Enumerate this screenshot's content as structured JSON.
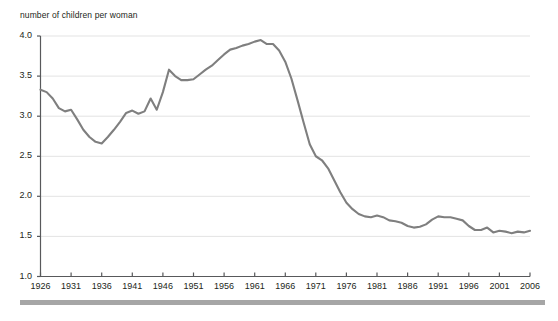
{
  "chart_data": {
    "type": "line",
    "title": "",
    "axis_note": "number of children per woman",
    "xlabel": "",
    "ylabel": "number of children per woman",
    "xlim": [
      1926,
      2006
    ],
    "ylim": [
      1.0,
      4.0
    ],
    "grid": true,
    "grid_axis": "y",
    "legend": false,
    "line_color": "#7f7f7f",
    "x_ticks": [
      1926,
      1931,
      1936,
      1941,
      1946,
      1951,
      1956,
      1961,
      1966,
      1971,
      1976,
      1981,
      1986,
      1991,
      1996,
      2001,
      2006
    ],
    "y_ticks": [
      "1.0",
      "1.5",
      "2.0",
      "2.5",
      "3.0",
      "3.5",
      "4.0"
    ],
    "series": [
      {
        "name": "number of children per woman",
        "x": [
          1926,
          1927,
          1928,
          1929,
          1930,
          1931,
          1932,
          1933,
          1934,
          1935,
          1936,
          1937,
          1938,
          1939,
          1940,
          1941,
          1942,
          1943,
          1944,
          1945,
          1946,
          1947,
          1948,
          1949,
          1950,
          1951,
          1952,
          1953,
          1954,
          1955,
          1956,
          1957,
          1958,
          1959,
          1960,
          1961,
          1962,
          1963,
          1964,
          1965,
          1966,
          1967,
          1968,
          1969,
          1970,
          1971,
          1972,
          1973,
          1974,
          1975,
          1976,
          1977,
          1978,
          1979,
          1980,
          1981,
          1982,
          1983,
          1984,
          1985,
          1986,
          1987,
          1988,
          1989,
          1990,
          1991,
          1992,
          1993,
          1994,
          1995,
          1996,
          1997,
          1998,
          1999,
          2000,
          2001,
          2002,
          2003,
          2004,
          2005,
          2006
        ],
        "values": [
          3.33,
          3.3,
          3.22,
          3.1,
          3.06,
          3.08,
          2.96,
          2.83,
          2.74,
          2.68,
          2.66,
          2.74,
          2.83,
          2.93,
          3.04,
          3.07,
          3.03,
          3.06,
          3.22,
          3.08,
          3.3,
          3.58,
          3.5,
          3.45,
          3.45,
          3.46,
          3.52,
          3.58,
          3.63,
          3.7,
          3.77,
          3.83,
          3.85,
          3.88,
          3.9,
          3.93,
          3.95,
          3.9,
          3.9,
          3.82,
          3.68,
          3.47,
          3.2,
          2.92,
          2.65,
          2.5,
          2.45,
          2.35,
          2.2,
          2.05,
          1.92,
          1.84,
          1.78,
          1.75,
          1.74,
          1.76,
          1.74,
          1.7,
          1.69,
          1.67,
          1.63,
          1.61,
          1.62,
          1.65,
          1.71,
          1.75,
          1.74,
          1.74,
          1.72,
          1.7,
          1.63,
          1.58,
          1.58,
          1.61,
          1.55,
          1.57,
          1.56,
          1.54,
          1.56,
          1.55,
          1.57
        ]
      }
    ]
  }
}
